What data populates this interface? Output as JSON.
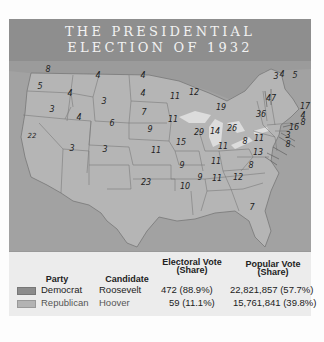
{
  "header_fragment": "...",
  "title": {
    "line1": "THE PRESIDENTIAL",
    "line2": "ELECTION OF 1932"
  },
  "map": {
    "state_electoral_votes": [
      {
        "state": "WA",
        "votes": "8"
      },
      {
        "state": "OR",
        "votes": "5"
      },
      {
        "state": "CA",
        "votes": "22"
      },
      {
        "state": "ID",
        "votes": "4"
      },
      {
        "state": "NV",
        "votes": "3"
      },
      {
        "state": "MT",
        "votes": "4"
      },
      {
        "state": "WY",
        "votes": "3"
      },
      {
        "state": "UT",
        "votes": "4"
      },
      {
        "state": "AZ",
        "votes": "3"
      },
      {
        "state": "CO",
        "votes": "6"
      },
      {
        "state": "NM",
        "votes": "3"
      },
      {
        "state": "ND",
        "votes": "4"
      },
      {
        "state": "SD",
        "votes": "4"
      },
      {
        "state": "NE",
        "votes": "7"
      },
      {
        "state": "KS",
        "votes": "9"
      },
      {
        "state": "OK",
        "votes": "11"
      },
      {
        "state": "TX",
        "votes": "23"
      },
      {
        "state": "MN",
        "votes": "11"
      },
      {
        "state": "IA",
        "votes": "11"
      },
      {
        "state": "MO",
        "votes": "15"
      },
      {
        "state": "AR",
        "votes": "9"
      },
      {
        "state": "LA",
        "votes": "10"
      },
      {
        "state": "WI",
        "votes": "12"
      },
      {
        "state": "IL",
        "votes": "29"
      },
      {
        "state": "MI",
        "votes": "19"
      },
      {
        "state": "IN",
        "votes": "14"
      },
      {
        "state": "OH",
        "votes": "26"
      },
      {
        "state": "KY",
        "votes": "11"
      },
      {
        "state": "TN",
        "votes": "11"
      },
      {
        "state": "MS",
        "votes": "9"
      },
      {
        "state": "AL",
        "votes": "11"
      },
      {
        "state": "GA",
        "votes": "12"
      },
      {
        "state": "FL",
        "votes": "7"
      },
      {
        "state": "SC",
        "votes": "8"
      },
      {
        "state": "NC",
        "votes": "13"
      },
      {
        "state": "VA",
        "votes": "11"
      },
      {
        "state": "WV",
        "votes": "8"
      },
      {
        "state": "PA",
        "votes": "36"
      },
      {
        "state": "NY",
        "votes": "47"
      },
      {
        "state": "VT",
        "votes": "3"
      },
      {
        "state": "NH",
        "votes": "4"
      },
      {
        "state": "ME",
        "votes": "5"
      },
      {
        "state": "MA",
        "votes": "17"
      },
      {
        "state": "RI",
        "votes": "4"
      },
      {
        "state": "CT",
        "votes": "8"
      },
      {
        "state": "NJ",
        "votes": "16"
      },
      {
        "state": "DE",
        "votes": "3"
      },
      {
        "state": "MD",
        "votes": "8"
      }
    ]
  },
  "legend": {
    "headers": {
      "party": "Party",
      "candidate": "Candidate",
      "electoral": "Electoral Vote (Share)",
      "popular": "Popular Vote (Share)"
    },
    "electoral_l1": "Electoral Vote",
    "electoral_l2": "(Share)",
    "popular_l1": "Popular Vote",
    "popular_l2": "(Share)",
    "rows": [
      {
        "party": "Democrat",
        "candidate": "Roosevelt",
        "electoral": "472 (88.9%)",
        "popular": "22,821,857 (57.7%)",
        "color": "#8c8c8c"
      },
      {
        "party": "Republican",
        "candidate": "Hoover",
        "electoral": "59 (11.1%)",
        "popular": "15,761,841 (39.8%)",
        "color": "#b3b3b3"
      }
    ]
  }
}
